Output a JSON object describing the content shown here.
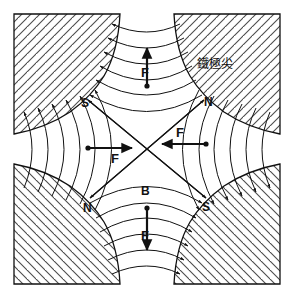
{
  "figure": {
    "type": "physics-field-diagram",
    "background": "#ffffff",
    "ink": "#111111",
    "hatch_color": "#555555",
    "width": 294,
    "height": 298
  },
  "annotation": {
    "pole_tip_caption": "鐵極尖"
  },
  "poles": [
    {
      "id": "top-left",
      "label": "S",
      "x": 84,
      "y": 103
    },
    {
      "id": "top-right",
      "label": "N",
      "x": 207,
      "y": 102
    },
    {
      "id": "bottom-left",
      "label": "N",
      "x": 87,
      "y": 208
    },
    {
      "id": "bottom-right",
      "label": "S",
      "x": 205,
      "y": 207
    }
  ],
  "vectors": [
    {
      "id": "force-top",
      "label": "F",
      "direction": "up",
      "label_x": 141,
      "label_y": 72
    },
    {
      "id": "force-bottom",
      "label": "F",
      "direction": "down",
      "label_x": 141,
      "label_y": 236
    },
    {
      "id": "force-left",
      "label": "F",
      "direction": "right",
      "label_x": 115,
      "label_y": 160
    },
    {
      "id": "force-right",
      "label": "F",
      "direction": "left",
      "label_x": 181,
      "label_y": 138
    }
  ],
  "field": {
    "label": "B",
    "label_x": 145,
    "label_y": 190,
    "description": "磁通密度 B 之磁力線"
  },
  "hatching": {
    "top_left": "45deg-up",
    "top_right": "45deg-up",
    "bottom_left": "45deg-down",
    "bottom_right": "45deg-down"
  }
}
